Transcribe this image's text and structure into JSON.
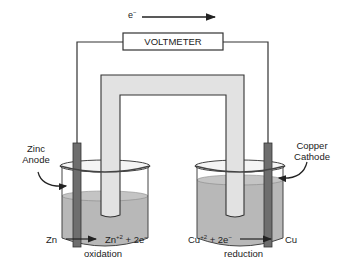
{
  "electron_flow": {
    "label": "e",
    "superscript": "−",
    "direction": "left-to-right"
  },
  "voltmeter": {
    "label": "VOLTMETER"
  },
  "anode": {
    "line1": "Zinc",
    "line2": "Anode"
  },
  "cathode": {
    "line1": "Copper",
    "line2": "Cathode"
  },
  "left_reaction": {
    "reactant": "Zn",
    "product": "Zn",
    "product_charge": "+2",
    "plus_electrons": "+ 2e",
    "electron_sup": "−",
    "type": "oxidation"
  },
  "right_reaction": {
    "reactant": "Cu",
    "reactant_charge": "+2",
    "plus_electrons": "+ 2e",
    "electron_sup": "−",
    "product": "Cu",
    "type": "reduction"
  },
  "colors": {
    "line": "#333333",
    "solution": "#b4b4b4",
    "electrode": "#6e6e6e",
    "salt_bridge": "#e2e2e2",
    "beaker_rim": "#f2f2f2"
  }
}
